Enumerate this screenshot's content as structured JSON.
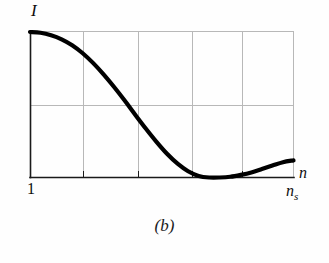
{
  "figure": {
    "caption": "(b)",
    "background_color": "#fefefe"
  },
  "axes": {
    "y_axis_label": "I",
    "x_axis_label": "n",
    "x_axis_start_label": "1",
    "x_axis_end_label": "n",
    "x_axis_end_sublabel": "s",
    "axis_color": "#1a1a1a",
    "grid_color": "#b8b8b8",
    "curve_color": "#000000"
  },
  "chart_data": {
    "type": "line",
    "title": "(b)",
    "xlabel": "n",
    "ylabel": "I",
    "grid": true,
    "legend": null,
    "xlim": [
      1,
      6
    ],
    "ylim": [
      0,
      1
    ],
    "xtick_labels": [
      "1",
      "",
      "",
      "",
      "",
      "n_s"
    ],
    "ytick_labels": [
      "",
      "",
      ""
    ],
    "x_gridlines": [
      1,
      2,
      3,
      4,
      5,
      6
    ],
    "y_gridlines": [
      0,
      0.5,
      1
    ],
    "annotation": "Intensity I decays from maximum at n = 1, falls to zero near n_s, then rises slightly",
    "series": [
      {
        "name": "I(n)",
        "x": [
          1.0,
          1.2,
          1.4,
          1.6,
          1.8,
          2.0,
          2.2,
          2.4,
          2.6,
          2.8,
          3.0,
          3.2,
          3.4,
          3.6,
          3.8,
          4.0,
          4.2,
          4.4,
          4.6,
          4.8,
          5.0,
          5.2,
          5.4,
          5.6,
          5.8,
          6.0
        ],
        "y": [
          1.0,
          0.995,
          0.978,
          0.95,
          0.909,
          0.854,
          0.786,
          0.707,
          0.62,
          0.527,
          0.43,
          0.335,
          0.245,
          0.163,
          0.095,
          0.043,
          0.011,
          0.0,
          0.0,
          0.005,
          0.018,
          0.035,
          0.058,
          0.082,
          0.105,
          0.118
        ]
      }
    ]
  }
}
